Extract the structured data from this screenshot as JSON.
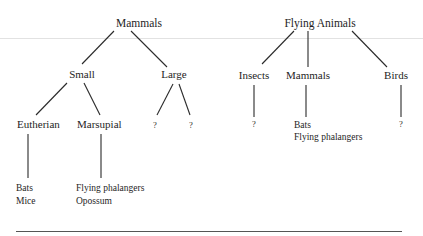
{
  "trees": {
    "left": {
      "root": "Mammals",
      "level1": [
        "Small",
        "Large"
      ],
      "level2": [
        "Eutherian",
        "Marsupial",
        "?",
        "?"
      ],
      "eutherian_members": [
        "Bats",
        "Mice"
      ],
      "marsupial_members": [
        "Flying phalangers",
        "Opossum"
      ]
    },
    "right": {
      "root": "Flying Animals",
      "level1": [
        "Insects",
        "Mammals",
        "Birds"
      ],
      "insects_members": [
        "?"
      ],
      "mammals_members": [
        "Bats",
        "Flying phalangers"
      ],
      "birds_members": [
        "?"
      ]
    }
  },
  "colors": {
    "text": "#1e1e1e",
    "lines": "#2a2a2a",
    "faint_rule": "#e2e2e2",
    "bottom_rule": "#555555",
    "background": "#ffffff"
  }
}
